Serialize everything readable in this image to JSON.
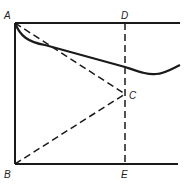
{
  "diagram": {
    "points": {
      "A": {
        "label": "A"
      },
      "B": {
        "label": "B"
      },
      "C": {
        "label": "C"
      },
      "D": {
        "label": "D"
      },
      "E": {
        "label": "E"
      }
    },
    "colors": {
      "stroke": "#1a1a1a",
      "background": "#ffffff"
    },
    "elements": [
      "solid top line from A through D",
      "solid vertical line A to B",
      "solid bottom line from B through E",
      "dashed vertical line D to E",
      "dashed line A to C",
      "dashed line B to C",
      "solid curve from A dipping and rising to the right"
    ]
  }
}
